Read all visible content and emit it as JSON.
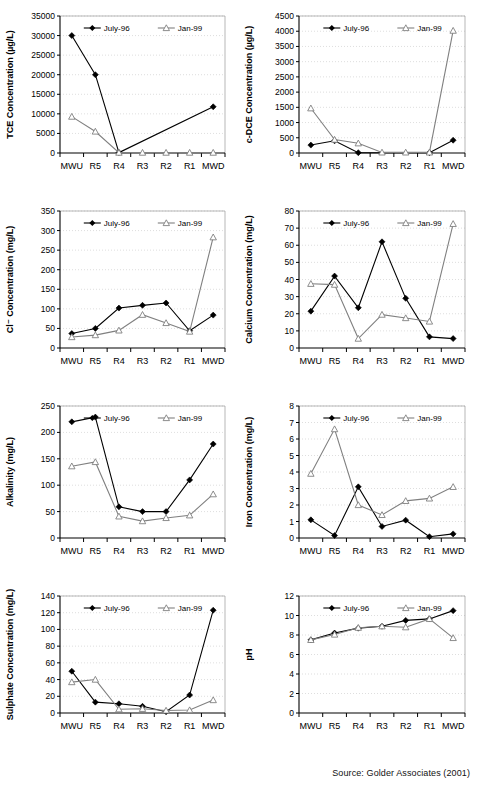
{
  "figure": {
    "source_note": "Source: Golder Associates (2001)",
    "categories": [
      "MWU",
      "R5",
      "R4",
      "R3",
      "R2",
      "R1",
      "MWD"
    ],
    "legend": {
      "series1": "July-96",
      "series2": "Jan-99"
    },
    "colors": {
      "series1": "#000000",
      "series2": "#808080",
      "axis": "#000000",
      "grid": "#c8c8c8",
      "background": "#ffffff"
    }
  },
  "chart_data": [
    {
      "id": "tce",
      "type": "line",
      "title": "",
      "xlabel": "",
      "ylabel": "TCE Concentration (µg/L)",
      "categories": [
        "MWU",
        "R5",
        "R4",
        "R3",
        "R2",
        "R1",
        "MWD"
      ],
      "ylim": [
        0,
        35000
      ],
      "yticks": [
        0,
        5000,
        10000,
        15000,
        20000,
        25000,
        30000,
        35000
      ],
      "grid": true,
      "legend_position": "top-center",
      "series": [
        {
          "name": "July-96",
          "values": [
            30000,
            20000,
            100,
            null,
            null,
            null,
            11800
          ]
        },
        {
          "name": "Jan-99",
          "values": [
            9300,
            5500,
            100,
            100,
            100,
            100,
            100
          ]
        }
      ]
    },
    {
      "id": "cdce",
      "type": "line",
      "title": "",
      "xlabel": "",
      "ylabel": "c-DCE Concentration (µg/L)",
      "categories": [
        "MWU",
        "R5",
        "R4",
        "R3",
        "R2",
        "R1",
        "MWD"
      ],
      "ylim": [
        0,
        4500
      ],
      "yticks": [
        0,
        500,
        1000,
        1500,
        2000,
        2500,
        3000,
        3500,
        4000,
        4500
      ],
      "grid": true,
      "legend_position": "top-center",
      "series": [
        {
          "name": "July-96",
          "values": [
            260,
            400,
            10,
            null,
            null,
            10,
            420
          ]
        },
        {
          "name": "Jan-99",
          "values": [
            1470,
            440,
            320,
            20,
            20,
            20,
            4020
          ]
        }
      ]
    },
    {
      "id": "chloride",
      "type": "line",
      "title": "",
      "xlabel": "",
      "ylabel": "Cl⁻ Concentration (mg/L)",
      "categories": [
        "MWU",
        "R5",
        "R4",
        "R3",
        "R2",
        "R1",
        "MWD"
      ],
      "ylim": [
        0,
        350
      ],
      "yticks": [
        0,
        50,
        100,
        150,
        200,
        250,
        300,
        350
      ],
      "grid": true,
      "legend_position": "top-center",
      "series": [
        {
          "name": "July-96",
          "values": [
            37,
            50,
            102,
            109,
            115,
            44,
            84
          ]
        },
        {
          "name": "Jan-99",
          "values": [
            28,
            33,
            45,
            85,
            64,
            42,
            283
          ]
        }
      ]
    },
    {
      "id": "calcium",
      "type": "line",
      "title": "",
      "xlabel": "",
      "ylabel": "Calcium Concentration (mg/L)",
      "categories": [
        "MWU",
        "R5",
        "R4",
        "R3",
        "R2",
        "R1",
        "MWD"
      ],
      "ylim": [
        0,
        80
      ],
      "yticks": [
        0,
        10,
        20,
        30,
        40,
        50,
        60,
        70,
        80
      ],
      "grid": true,
      "legend_position": "top-center",
      "series": [
        {
          "name": "July-96",
          "values": [
            21.5,
            42,
            23.5,
            62,
            29,
            6.5,
            5.5
          ]
        },
        {
          "name": "Jan-99",
          "values": [
            37.5,
            37,
            5.5,
            19.5,
            17.5,
            15.5,
            72.5
          ]
        }
      ]
    },
    {
      "id": "alkalinity",
      "type": "line",
      "title": "",
      "xlabel": "",
      "ylabel": "Alkalinity (mg/L)",
      "categories": [
        "MWU",
        "R5",
        "R4",
        "R3",
        "R2",
        "R1",
        "MWD"
      ],
      "ylim": [
        0,
        250
      ],
      "yticks": [
        0,
        50,
        100,
        150,
        200,
        250
      ],
      "grid": true,
      "legend_position": "top-center",
      "series": [
        {
          "name": "July-96",
          "values": [
            220,
            229,
            59,
            50,
            50,
            110,
            178
          ]
        },
        {
          "name": "Jan-99",
          "values": [
            136,
            144,
            41,
            32,
            38,
            43,
            83
          ]
        }
      ]
    },
    {
      "id": "iron",
      "type": "line",
      "title": "",
      "xlabel": "",
      "ylabel": "Iron Concentration (mg/L)",
      "categories": [
        "MWU",
        "R5",
        "R4",
        "R3",
        "R2",
        "R1",
        "MWD"
      ],
      "ylim": [
        0,
        8
      ],
      "yticks": [
        0,
        1,
        2,
        3,
        4,
        5,
        6,
        7,
        8
      ],
      "grid": true,
      "legend_position": "top-center",
      "series": [
        {
          "name": "July-96",
          "values": [
            1.1,
            0.15,
            3.1,
            0.7,
            1.08,
            0.08,
            0.25
          ]
        },
        {
          "name": "Jan-99",
          "values": [
            3.9,
            6.6,
            2.0,
            1.4,
            2.25,
            2.4,
            3.1
          ]
        }
      ]
    },
    {
      "id": "sulphate",
      "type": "line",
      "title": "",
      "xlabel": "",
      "ylabel": "Sulphate Concentration (mg/L)",
      "categories": [
        "MWU",
        "R5",
        "R4",
        "R3",
        "R2",
        "R1",
        "MWD"
      ],
      "ylim": [
        0,
        140
      ],
      "yticks": [
        0,
        20,
        40,
        60,
        80,
        100,
        120,
        140
      ],
      "grid": true,
      "legend_position": "top-center",
      "series": [
        {
          "name": "July-96",
          "values": [
            50,
            13,
            11,
            8,
            1.5,
            21.5,
            123
          ]
        },
        {
          "name": "Jan-99",
          "values": [
            37,
            40,
            4.5,
            5,
            3,
            3.5,
            15.5
          ]
        }
      ]
    },
    {
      "id": "ph",
      "type": "line",
      "title": "",
      "xlabel": "",
      "ylabel": "pH",
      "categories": [
        "MWU",
        "R5",
        "R4",
        "R3",
        "R2",
        "R1",
        "MWD"
      ],
      "ylim": [
        0,
        12
      ],
      "yticks": [
        0,
        2,
        4,
        6,
        8,
        10,
        12
      ],
      "grid": true,
      "legend_position": "top-center",
      "series": [
        {
          "name": "July-96",
          "values": [
            7.5,
            8.2,
            8.7,
            8.9,
            9.5,
            9.65,
            10.5
          ]
        },
        {
          "name": "Jan-99",
          "values": [
            7.5,
            8.05,
            8.75,
            8.9,
            8.8,
            9.65,
            7.7
          ]
        }
      ]
    }
  ]
}
